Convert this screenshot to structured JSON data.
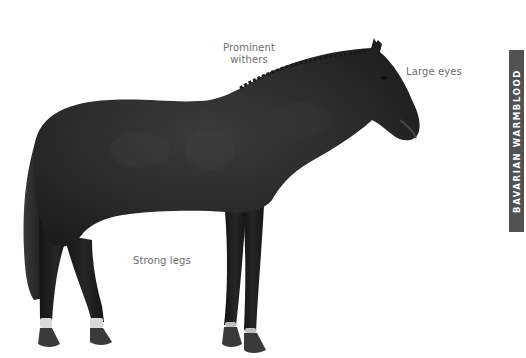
{
  "page": {
    "background": "#ffffff"
  },
  "image": {
    "subject": "horse-side-profile",
    "coat_color": "#262626",
    "hoof_color": "#3a3a3a",
    "sock_color": "#d9d9d9"
  },
  "annotations": {
    "withers": {
      "line1": "Prominent",
      "line2": "withers"
    },
    "eyes": "Large eyes",
    "legs": "Strong legs"
  },
  "side_tab": {
    "label": "BAVARIAN WARMBLOOD",
    "background": "#525252",
    "text_color": "#ffffff"
  }
}
